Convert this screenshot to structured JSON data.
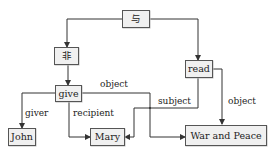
{
  "diagram": {
    "type": "semantic-graph",
    "colors": {
      "node_fill": "#f0f0f0",
      "node_border": "#555555",
      "edge": "#333333",
      "text": "#222222",
      "background": "#ffffff"
    },
    "nodes": [
      {
        "id": "and",
        "label": "与"
      },
      {
        "id": "not",
        "label": "非"
      },
      {
        "id": "read",
        "label": "read"
      },
      {
        "id": "give",
        "label": "give"
      },
      {
        "id": "john",
        "label": "John"
      },
      {
        "id": "mary",
        "label": "Mary"
      },
      {
        "id": "wap",
        "label": "War and Peace"
      }
    ],
    "edges": [
      {
        "from": "and",
        "to": "not",
        "label": ""
      },
      {
        "from": "and",
        "to": "read",
        "label": ""
      },
      {
        "from": "not",
        "to": "give",
        "label": ""
      },
      {
        "from": "give",
        "to": "john",
        "label": "giver"
      },
      {
        "from": "give",
        "to": "mary",
        "label": "recipient"
      },
      {
        "from": "give",
        "to": "wap",
        "label": "object"
      },
      {
        "from": "read",
        "to": "mary",
        "label": "subject"
      },
      {
        "from": "read",
        "to": "wap",
        "label": "object"
      }
    ]
  }
}
